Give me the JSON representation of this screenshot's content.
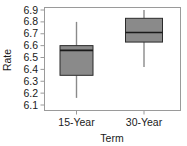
{
  "chart_data": {
    "type": "box",
    "title": "",
    "xlabel": "Term",
    "ylabel": "Rate",
    "categories": [
      "15-Year",
      "30-Year"
    ],
    "ylim": [
      6.1,
      6.9
    ],
    "yticks": [
      6.9,
      6.8,
      6.7,
      6.6,
      6.5,
      6.4,
      6.3,
      6.2,
      6.1
    ],
    "ytick_labels": [
      "6.9",
      "6.8",
      "6.7",
      "6.6",
      "6.5",
      "6.4",
      "6.3",
      "6.2",
      "6.1"
    ],
    "grid": false,
    "legend": false,
    "box_fill_color": "#8a8a8a",
    "box_edge_color": "#2b2b2b",
    "whisker_color": "#8a8a8a",
    "frame_color": "#9a9a9a",
    "boxes": [
      {
        "category": "15-Year",
        "whisker_low": 6.16,
        "q1": 6.35,
        "median": 6.56,
        "q3": 6.6,
        "whisker_high": 6.8
      },
      {
        "category": "30-Year",
        "whisker_low": 6.42,
        "q1": 6.63,
        "median": 6.71,
        "q3": 6.83,
        "whisker_high": 6.9
      }
    ]
  }
}
